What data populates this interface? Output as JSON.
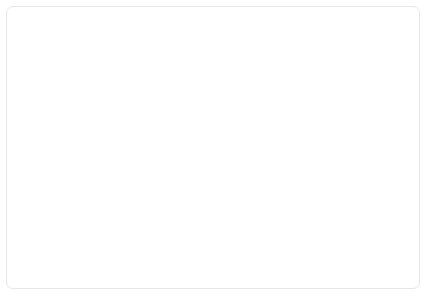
{
  "chart_data": {
    "type": "line",
    "title": "",
    "xlabel": "Year",
    "ylabel": "Percent of twelfth graders",
    "ylabel_lines": [
      "Percent",
      "of",
      "twelfth",
      "graders"
    ],
    "ylim": [
      0,
      100
    ],
    "xlim": [
      1975,
      2002
    ],
    "grid": true,
    "legend_position": "inline-annotations",
    "ytick_labels": [
      "0",
      "10",
      "20",
      "30",
      "40",
      "50",
      "60",
      "70",
      "80",
      "90",
      "100%"
    ],
    "ytick_values": [
      0,
      10,
      20,
      30,
      40,
      50,
      60,
      70,
      80,
      90,
      100
    ],
    "xtick_labels": [
      "'75",
      "'77",
      "'79",
      "'81",
      "'83",
      "'85",
      "'87",
      "'89",
      "'91",
      "'93",
      "'95",
      "'97",
      "'99",
      "'01"
    ],
    "xtick_values": [
      1975,
      1977,
      1979,
      1981,
      1983,
      1985,
      1987,
      1989,
      1991,
      1993,
      1995,
      1997,
      1999,
      2001
    ],
    "x": [
      1975,
      1976,
      1977,
      1978,
      1979,
      1980,
      1981,
      1982,
      1983,
      1984,
      1985,
      1986,
      1987,
      1988,
      1989,
      1990,
      1991,
      1992,
      1993,
      1994,
      1995,
      1996,
      1997,
      1998,
      1999,
      2000,
      2001,
      2002
    ],
    "series": [
      {
        "name": "Perceived \"great risk of harm\" in marijuana use",
        "color": "#e2e2e2",
        "values": [
          43,
          39,
          36,
          35,
          42,
          50,
          57,
          60,
          63,
          67,
          70,
          71,
          74,
          77,
          77,
          78,
          79,
          77,
          72,
          65,
          61,
          60,
          58,
          58,
          57,
          58,
          58,
          57
        ]
      },
      {
        "name": "Used marijuana",
        "color": "#bcbcbc",
        "values": [
          27,
          32,
          35,
          37,
          37,
          36,
          34,
          32,
          30,
          29,
          26,
          25,
          25,
          21,
          17,
          15,
          14,
          12,
          11,
          16,
          20,
          21,
          23,
          22,
          22,
          22,
          21,
          22
        ]
      }
    ],
    "annotations": [
      {
        "id": "risk-annotation",
        "text_lines": [
          "Perceived “great risk of",
          "harm” in marijuana use"
        ],
        "text_x": 132,
        "text_y": 47,
        "leader_from_x": 193,
        "leader_from_y": 66,
        "leader_to_x": 212,
        "leader_to_y": 97
      },
      {
        "id": "use-annotation",
        "text_lines": [
          "Used marijuana"
        ],
        "text_x": 258,
        "text_y": 176,
        "leader_from_x": 272,
        "leader_from_y": 182,
        "leader_to_x": 258,
        "leader_to_y": 213
      }
    ]
  },
  "axes": {
    "x_title": "Year"
  },
  "colors": {
    "series_light": "#e2e2e2",
    "series_dark": "#bcbcbc",
    "grid": "#d2d2d2",
    "axis": "#9a9a9a",
    "text": "#2b2b2b",
    "frame": "#e6e6e6",
    "background": "#ffffff"
  }
}
